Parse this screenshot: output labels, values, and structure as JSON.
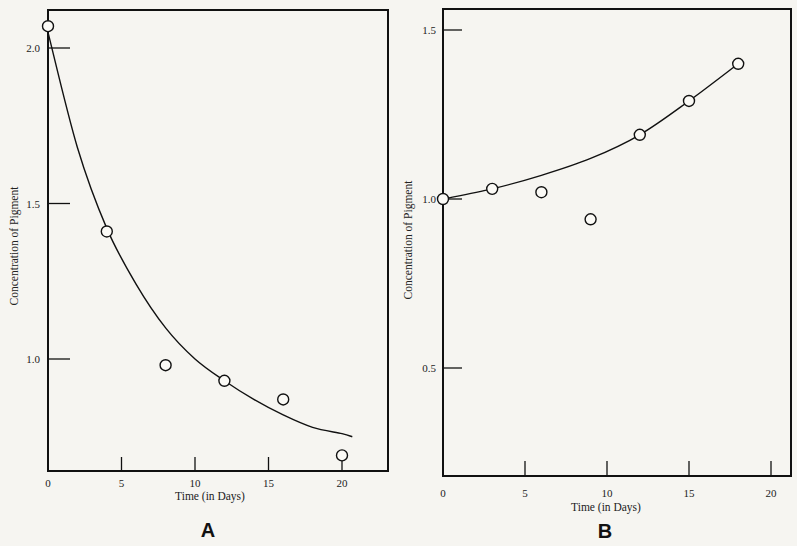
{
  "chart_data": [
    {
      "panel": "A",
      "type": "scatter",
      "title": "",
      "xlabel": "Time (in Days)",
      "ylabel": "Concentration of Pigment",
      "x_ticks": [
        "0",
        "5",
        "10",
        "15",
        "20"
      ],
      "y_ticks": [
        "1.0",
        "1.5",
        "2.0"
      ],
      "xlim": [
        0,
        23
      ],
      "ylim": [
        0.65,
        2.12
      ],
      "grid": false,
      "series": [
        {
          "name": "observed",
          "marker": "open-circle",
          "x": [
            0,
            4,
            8,
            12,
            16,
            20
          ],
          "y": [
            2.07,
            1.41,
            0.98,
            0.93,
            0.87,
            0.69
          ]
        },
        {
          "name": "fitted curve",
          "style": "line",
          "shape": "exponential decay",
          "x": [
            0,
            2,
            4,
            6,
            8,
            10,
            12,
            14,
            16,
            18,
            20,
            20.7
          ],
          "y": [
            2.05,
            1.68,
            1.42,
            1.24,
            1.1,
            1.0,
            0.93,
            0.87,
            0.82,
            0.78,
            0.76,
            0.75
          ]
        }
      ]
    },
    {
      "panel": "B",
      "type": "scatter",
      "title": "",
      "xlabel": "Time (in Days)",
      "ylabel": "Concentration of Pigment",
      "x_ticks": [
        "0",
        "5",
        "10",
        "15",
        "20"
      ],
      "y_ticks": [
        "0.5",
        "1.0",
        "1.5"
      ],
      "xlim": [
        0,
        20.5
      ],
      "ylim": [
        0.2,
        1.55
      ],
      "grid": false,
      "series": [
        {
          "name": "observed",
          "marker": "open-circle",
          "x": [
            0,
            3,
            6,
            9,
            12,
            15,
            18
          ],
          "y": [
            1.0,
            1.03,
            1.02,
            0.94,
            1.19,
            1.29,
            1.4
          ]
        },
        {
          "name": "fitted curve",
          "style": "line",
          "shape": "exponential growth",
          "x": [
            0,
            3,
            6,
            9,
            12,
            15,
            18
          ],
          "y": [
            1.0,
            1.03,
            1.07,
            1.12,
            1.19,
            1.29,
            1.4
          ]
        }
      ]
    }
  ],
  "panels": {
    "A": {
      "label": "A",
      "xlabel": "Time (in Days)",
      "ylabel": "Concentration of Pigment"
    },
    "B": {
      "label": "B",
      "xlabel": "Time (in Days)",
      "ylabel": "Concentration of Pigment"
    }
  }
}
